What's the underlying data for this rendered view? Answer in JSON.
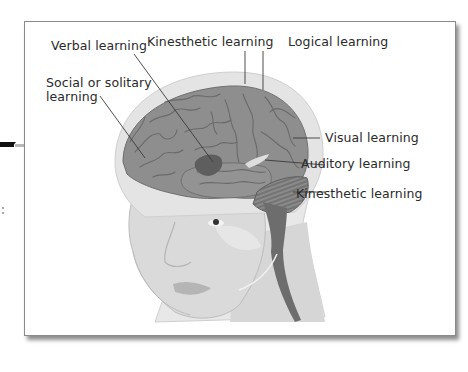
{
  "figure": {
    "colors": {
      "frame_border": "#8a8a8a",
      "skin": "#dcdcdc",
      "skin_shadow": "#cdcdcd",
      "skull_halo": "#e6e6e6",
      "brain": "#8d8d8d",
      "brain_fold": "#6f6f6f",
      "verbal_region": "#5e5e5e",
      "auditory_region": "#d9d9d9",
      "cerebellum": "#7a7a7a",
      "spinal_cord": "#6a6a6a",
      "label_text": "#2a2a2a",
      "leader_line": "#3a3a3a"
    },
    "labels": [
      {
        "id": "verbal",
        "text": "Verbal learning"
      },
      {
        "id": "kinesthetic_top",
        "text": "Kinesthetic learning"
      },
      {
        "id": "logical",
        "text": "Logical learning"
      },
      {
        "id": "social_line1",
        "text": "Social or solitary"
      },
      {
        "id": "social_line2",
        "text": "learning"
      },
      {
        "id": "visual",
        "text": "Visual learning"
      },
      {
        "id": "auditory",
        "text": "Auditory learning"
      },
      {
        "id": "kinesthetic_bottom",
        "text": "Kinesthetic learning"
      }
    ]
  }
}
